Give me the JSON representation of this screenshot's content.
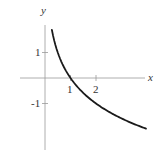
{
  "chart_data": {
    "type": "line",
    "title": "",
    "xlabel": "x",
    "ylabel": "y",
    "function": "y = -log2(x)",
    "x_ticks": [
      {
        "value": 1,
        "label": "1"
      },
      {
        "value": 2,
        "label": "2"
      }
    ],
    "y_ticks": [
      {
        "value": 1,
        "label": "1"
      },
      {
        "value": -1,
        "label": "-1"
      }
    ],
    "xlim": [
      -1,
      4
    ],
    "ylim": [
      -2.8,
      2.1
    ],
    "grid": false,
    "legend": null,
    "series": [
      {
        "name": "curve",
        "x": [
          0.27,
          0.35,
          0.5,
          0.7,
          1,
          1.5,
          2,
          2.5,
          3,
          3.5,
          3.96
        ],
        "y": [
          1.89,
          1.51,
          1.0,
          0.51,
          0,
          -0.58,
          -1.0,
          -1.32,
          -1.58,
          -1.81,
          -1.99
        ],
        "color": "#1a1a1a"
      }
    ]
  },
  "axes": {
    "x_label": "x",
    "y_label": "y",
    "x_tick_labels": [
      "1",
      "2"
    ],
    "y_tick_labels": [
      "1",
      "-1"
    ]
  }
}
